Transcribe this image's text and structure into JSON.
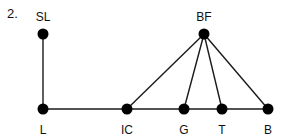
{
  "figure": {
    "number_label": "2.",
    "colors": {
      "edge": "#1a1a1a",
      "node": "#000000",
      "text": "#111111"
    },
    "nodes": [
      {
        "id": "SL",
        "label": "SL",
        "x": 43,
        "y": 34,
        "label_pos": "above"
      },
      {
        "id": "BF",
        "label": "BF",
        "x": 204,
        "y": 34,
        "label_pos": "above"
      },
      {
        "id": "L",
        "label": "L",
        "x": 43,
        "y": 109,
        "label_pos": "below"
      },
      {
        "id": "IC",
        "label": "IC",
        "x": 127,
        "y": 109,
        "label_pos": "below"
      },
      {
        "id": "G",
        "label": "G",
        "x": 184,
        "y": 109,
        "label_pos": "below"
      },
      {
        "id": "T",
        "label": "T",
        "x": 222,
        "y": 109,
        "label_pos": "below"
      },
      {
        "id": "B",
        "label": "B",
        "x": 268,
        "y": 109,
        "label_pos": "below"
      }
    ],
    "edges": [
      {
        "from": "SL",
        "to": "L"
      },
      {
        "from": "L",
        "to": "IC"
      },
      {
        "from": "IC",
        "to": "G"
      },
      {
        "from": "G",
        "to": "T"
      },
      {
        "from": "T",
        "to": "B"
      },
      {
        "from": "BF",
        "to": "IC"
      },
      {
        "from": "BF",
        "to": "G"
      },
      {
        "from": "BF",
        "to": "T"
      },
      {
        "from": "BF",
        "to": "B"
      }
    ]
  }
}
